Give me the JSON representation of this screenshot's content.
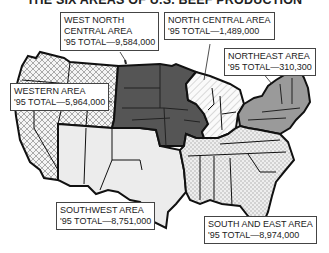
{
  "title": "THE SIX AREAS OF U.S. BEEF PRODUCTION",
  "areas": [
    {
      "name": "WEST NORTH CENTRAL AREA",
      "line1": "WEST NORTH",
      "line2": "CENTRAL AREA",
      "total_label": "'95 TOTAL—9,584,000",
      "total": 9584000,
      "pattern": "dark-solid",
      "color": "#555555"
    },
    {
      "name": "NORTH CENTRAL AREA",
      "line1": "NORTH CENTRAL AREA",
      "total_label": "'95 TOTAL—1,489,000",
      "total": 1489000,
      "pattern": "diagonal-stripes",
      "color": "#f2f2f2"
    },
    {
      "name": "NORTHEAST AREA",
      "line1": "NORTHEAST AREA",
      "total_label": "'95 TOTAL—310,300",
      "total": 310300,
      "pattern": "medium-gray",
      "color": "#9a9a9a"
    },
    {
      "name": "WESTERN AREA",
      "line1": "WESTERN AREA",
      "total_label": "'95 TOTAL—5,964,000",
      "total": 5964000,
      "pattern": "crosshatch",
      "color": "#e8e8e8"
    },
    {
      "name": "SOUTHWEST AREA",
      "line1": "SOUTHWEST AREA",
      "total_label": "'95 TOTAL—8,751,000",
      "total": 8751000,
      "pattern": "light-gray",
      "color": "#ececec"
    },
    {
      "name": "SOUTH AND EAST AREA",
      "line1": "SOUTH AND EAST AREA",
      "total_label": "'95 TOTAL—8,974,000",
      "total": 8974000,
      "pattern": "dots",
      "color": "#dcdcdc"
    }
  ]
}
